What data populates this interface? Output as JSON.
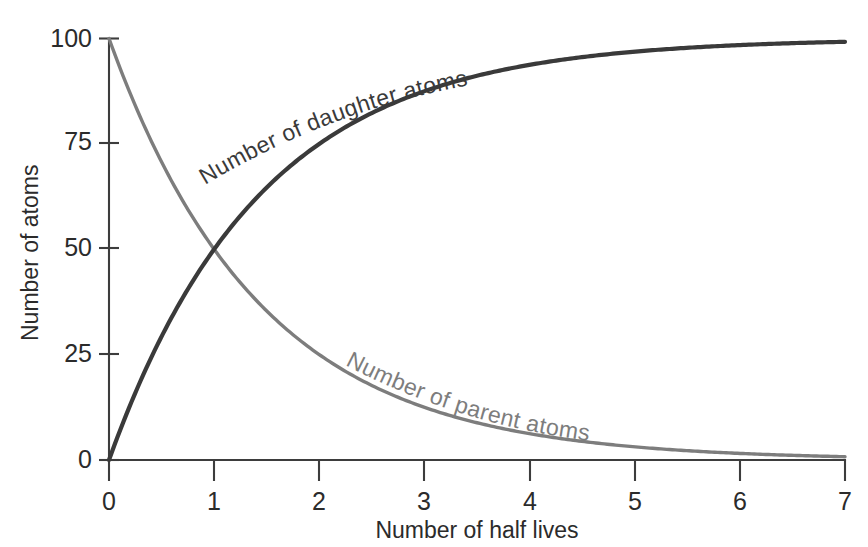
{
  "chart_data": {
    "type": "line",
    "title": "",
    "xlabel": "Number of half lives",
    "ylabel": "Number of atoms",
    "xlim": [
      0,
      7
    ],
    "ylim": [
      0,
      100
    ],
    "xticks": [
      "0",
      "1",
      "2",
      "3",
      "4",
      "5",
      "6",
      "7"
    ],
    "yticks": [
      "0",
      "25",
      "50",
      "75",
      "100"
    ],
    "grid": false,
    "legend_position": "inline-curve-labels",
    "annotations": [
      "Number of daughter atoms",
      "Number of parent atoms"
    ],
    "x": [
      0,
      0.25,
      0.5,
      0.75,
      1,
      1.25,
      1.5,
      1.75,
      2,
      2.5,
      3,
      3.5,
      4,
      4.5,
      5,
      5.5,
      6,
      6.5,
      7
    ],
    "series": [
      {
        "name": "Number of parent atoms",
        "color": "#7d7d7d",
        "values": [
          100,
          84.1,
          70.7,
          59.5,
          50,
          42.0,
          35.4,
          29.7,
          25,
          17.7,
          12.5,
          8.8,
          6.25,
          4.4,
          3.1,
          2.2,
          1.6,
          1.1,
          0.8
        ]
      },
      {
        "name": "Number of daughter atoms",
        "color": "#3a3a3a",
        "values": [
          0,
          15.9,
          29.3,
          40.5,
          50,
          58.0,
          64.6,
          70.3,
          75,
          82.3,
          87.5,
          91.2,
          93.75,
          95.6,
          96.9,
          97.8,
          98.4,
          98.9,
          99.2
        ]
      }
    ],
    "crossing_point": {
      "x": 1,
      "y": 50
    }
  },
  "labels": {
    "y_axis_title": "Number of atoms",
    "x_axis_title": "Number of half lives",
    "daughter_curve": "Number of daughter atoms",
    "parent_curve": "Number of parent atoms"
  },
  "colors": {
    "parent": "#7d7d7d",
    "daughter": "#3a3a3a",
    "axis": "#3d3d3d",
    "text": "#2b2b2b",
    "background": "#ffffff"
  }
}
